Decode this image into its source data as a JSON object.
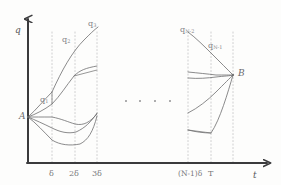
{
  "figure": {
    "kind": "hand-drawn-sketch",
    "ink_color": "#6f6f70",
    "axis_color": "#3a3a3c",
    "grid_color": "#c9c9cc",
    "paper_color": "#fdfdfc"
  },
  "axes": {
    "y_label": "q",
    "x_label": "t",
    "origin": {
      "x": 28,
      "y": 163
    },
    "x_axis_end": {
      "x": 272,
      "y": 163
    },
    "y_axis_top": {
      "x": 28,
      "y": 14
    }
  },
  "gridlines": [
    {
      "id": "d1",
      "label": "δ",
      "x": 52,
      "top": 32,
      "bottom": 163
    },
    {
      "id": "d2",
      "label": "2δ",
      "x": 75,
      "top": 32,
      "bottom": 163
    },
    {
      "id": "d3",
      "label": "3δ",
      "x": 97,
      "top": 32,
      "bottom": 163
    },
    {
      "id": "dn1",
      "label": "(N-1)δ",
      "x": 188,
      "top": 32,
      "bottom": 163
    },
    {
      "id": "dn",
      "label": "T",
      "x": 211,
      "top": 32,
      "bottom": 163
    },
    {
      "id": "dT",
      "label": "",
      "x": 233,
      "top": 32,
      "bottom": 163
    }
  ],
  "tick_labels": [
    {
      "text": "δ",
      "x": 49,
      "y": 170
    },
    {
      "text": "2δ",
      "x": 69,
      "y": 170
    },
    {
      "text": "3δ",
      "x": 92,
      "y": 170
    },
    {
      "text": "(N-1)δ",
      "x": 178,
      "y": 170
    },
    {
      "text": "T",
      "x": 208,
      "y": 170
    },
    {
      "text": "t",
      "x": 253,
      "y": 171
    }
  ],
  "nodes": [
    {
      "id": "A",
      "label": "A",
      "x": 28,
      "y": 117,
      "label_x": 19,
      "label_y": 112
    },
    {
      "id": "B",
      "label": "B",
      "x": 233,
      "y": 75,
      "label_x": 238,
      "label_y": 69
    }
  ],
  "path_labels": [
    {
      "id": "q1",
      "base": "q",
      "sub": "1",
      "x": 40,
      "y": 96
    },
    {
      "id": "q2",
      "base": "q",
      "sub": "2",
      "x": 62,
      "y": 36
    },
    {
      "id": "q3",
      "base": "q",
      "sub": "3",
      "x": 88,
      "y": 20
    },
    {
      "id": "qN2",
      "base": "q",
      "sub": "N-2",
      "x": 180,
      "y": 26
    },
    {
      "id": "qN1",
      "base": "q",
      "sub": "N-1",
      "x": 208,
      "y": 42
    }
  ],
  "ellipsis_dots": [
    {
      "x": 126,
      "y": 101
    },
    {
      "x": 140,
      "y": 101
    },
    {
      "x": 155,
      "y": 101
    },
    {
      "x": 170,
      "y": 101
    }
  ],
  "left_paths": [
    {
      "id": "L1",
      "d": "M28,117 C36,110 44,100 52,92 C62,70 72,52 84,40 C90,34 94,30 98,27"
    },
    {
      "id": "L2",
      "d": "M28,117 C36,114 44,110 52,104 C60,96 66,86 74,76 C80,70 86,68 97,66"
    },
    {
      "id": "L3",
      "d": "M28,117 C34,117 42,117 52,117 C62,119 68,122 75,124 C84,126 90,122 97,114"
    },
    {
      "id": "L4",
      "d": "M28,117 C35,120 44,124 52,128 C60,132 68,134 76,132 C85,128 91,122 97,113"
    },
    {
      "id": "L5",
      "d": "M28,117 C36,123 44,132 52,140 C60,145 70,146 80,144 C88,140 93,132 97,116"
    }
  ],
  "left_connectors": [
    {
      "id": "LC1",
      "d": "M74,76 L97,70"
    },
    {
      "id": "LC2",
      "d": "M52,92 L52,104"
    }
  ],
  "right_paths": [
    {
      "id": "R1",
      "d": "M188,32 C196,38 204,46 212,54 C220,62 228,70 233,75"
    },
    {
      "id": "R2",
      "d": "M188,72 C198,73 208,74 216,75 C224,75 230,75 233,75"
    },
    {
      "id": "R3",
      "d": "M188,78 C198,79 208,78 216,77 C224,76 230,76 233,75"
    },
    {
      "id": "R4",
      "d": "M188,113 C198,108 208,100 216,92 C224,84 230,78 233,75"
    },
    {
      "id": "R5",
      "d": "M188,130 C196,132 204,133 211,133 C220,120 228,92 233,75"
    }
  ],
  "right_connectors": [
    {
      "id": "RC1",
      "d": "M188,130 L211,133"
    }
  ]
}
